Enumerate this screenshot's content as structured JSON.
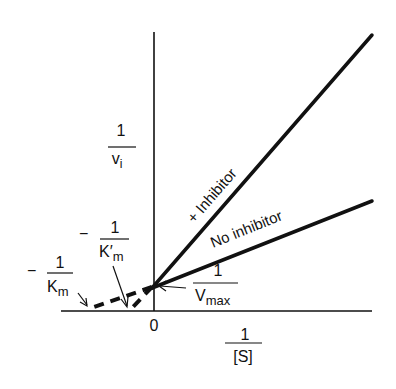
{
  "axes": {
    "y_label_num": "1",
    "y_label_den": "v",
    "y_label_sub": "i",
    "x_label_num": "1",
    "x_label_den": "[S]",
    "origin_label": "0"
  },
  "lines": {
    "inhibitor_label": "+ Inhibitor",
    "no_inhibitor_label": "No inhibitor"
  },
  "annotations": {
    "km_prime": {
      "sign": "−",
      "num": "1",
      "den": "K′",
      "sub": "m"
    },
    "km": {
      "sign": "−",
      "num": "1",
      "den": "K",
      "sub": "m"
    },
    "vmax": {
      "num": "1",
      "den": "V",
      "sub": "max"
    }
  },
  "colors": {
    "ink": "#111111",
    "background": "#ffffff"
  }
}
